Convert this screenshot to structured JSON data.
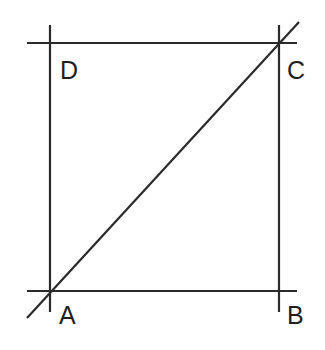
{
  "diagram": {
    "type": "square-with-diagonal",
    "stroke_color": "#2a2a2a",
    "label_color": "#1e1e1e",
    "vertices": {
      "A": {
        "label": "A",
        "x": 50,
        "y": 291
      },
      "B": {
        "label": "B",
        "x": 279,
        "y": 291
      },
      "C": {
        "label": "C",
        "x": 279,
        "y": 43
      },
      "D": {
        "label": "D",
        "x": 50,
        "y": 43
      }
    },
    "lines": [
      {
        "name": "line-DC",
        "x1": 27,
        "y1": 43,
        "x2": 297,
        "y2": 43
      },
      {
        "name": "line-AB",
        "x1": 27,
        "y1": 291,
        "x2": 297,
        "y2": 291
      },
      {
        "name": "line-AD",
        "x1": 50,
        "y1": 25,
        "x2": 50,
        "y2": 312
      },
      {
        "name": "line-BC",
        "x1": 279,
        "y1": 25,
        "x2": 279,
        "y2": 312
      },
      {
        "name": "diagonal-AC",
        "x1": 27,
        "y1": 318,
        "x2": 299,
        "y2": 22
      }
    ]
  }
}
